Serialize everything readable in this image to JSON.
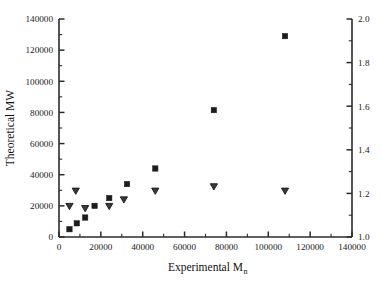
{
  "chart_data": {
    "type": "scatter",
    "title": "",
    "xlabel": "Experimental Mn",
    "xlabel_main": "Experimental M",
    "xlabel_sub": "n",
    "ylabel_left": "Theoretical MW",
    "ylabel_right": "",
    "grid": false,
    "legend_position": "none",
    "xlim": [
      0,
      140000
    ],
    "ylim_left": [
      0,
      140000
    ],
    "ylim_right": [
      1.0,
      2.0
    ],
    "xticks": [
      0,
      20000,
      40000,
      60000,
      80000,
      100000,
      120000,
      140000
    ],
    "xticklabels": [
      "0",
      "20000",
      "40000",
      "60000",
      "80000",
      "100000",
      "120000",
      "140000"
    ],
    "yticks_left": [
      0,
      20000,
      40000,
      60000,
      80000,
      100000,
      120000,
      140000
    ],
    "yticklabels_left": [
      "0",
      "20000",
      "40000",
      "60000",
      "80000",
      "100000",
      "120000",
      "140000"
    ],
    "yticks_right": [
      1.0,
      1.2,
      1.4,
      1.6,
      1.8,
      2.0
    ],
    "yticklabels_right": [
      "1.0",
      "1.2",
      "1.4",
      "1.6",
      "1.8",
      "2.0"
    ],
    "x_minor_ticks_per_interval": 1,
    "y_minor_ticks_per_interval": 1,
    "series": [
      {
        "name": "Theoretical MW",
        "marker": "filled-square",
        "axis": "left",
        "color": "#1c1c1c",
        "points": [
          {
            "x": 5000,
            "y": 5000
          },
          {
            "x": 8500,
            "y": 8800
          },
          {
            "x": 12500,
            "y": 12500
          },
          {
            "x": 17000,
            "y": 20000
          },
          {
            "x": 24000,
            "y": 25000
          },
          {
            "x": 32500,
            "y": 34000
          },
          {
            "x": 46000,
            "y": 44000
          },
          {
            "x": 74000,
            "y": 81500
          },
          {
            "x": 108000,
            "y": 129000
          }
        ]
      },
      {
        "name": "Polydispersity",
        "marker": "open-down-triangle",
        "axis": "right",
        "color": "#3a3a3a",
        "points": [
          {
            "x": 5000,
            "y": 1.14
          },
          {
            "x": 8000,
            "y": 1.21
          },
          {
            "x": 12500,
            "y": 1.13
          },
          {
            "x": 24000,
            "y": 1.14
          },
          {
            "x": 31000,
            "y": 1.17
          },
          {
            "x": 46000,
            "y": 1.21
          },
          {
            "x": 74000,
            "y": 1.23
          },
          {
            "x": 108000,
            "y": 1.21
          }
        ]
      }
    ]
  },
  "plot_geometry": {
    "left": 59,
    "right": 352,
    "top": 19,
    "bottom": 237
  }
}
